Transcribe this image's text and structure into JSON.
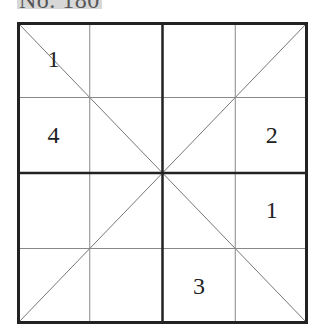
{
  "puzzle": {
    "title": "No. 180",
    "size": 4,
    "type": "diagonal-sudoku",
    "grid": [
      [
        "1",
        "",
        "",
        ""
      ],
      [
        "4",
        "",
        "",
        "2"
      ],
      [
        "",
        "",
        "",
        "1"
      ],
      [
        "",
        "",
        "3",
        ""
      ]
    ]
  },
  "colors": {
    "grid_line": "#222222",
    "thin_line": "#888888",
    "diagonal": "#777777",
    "title_bg": "#d7d7d7"
  }
}
